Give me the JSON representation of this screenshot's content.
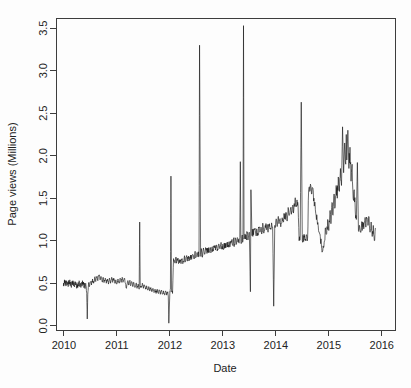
{
  "figure": {
    "background_color": "#fdfdfd",
    "line_color": "#111111",
    "axis_color": "#3d3d3d",
    "title_fragment": ""
  },
  "chart_data": {
    "type": "line",
    "title": "",
    "xlabel": "Date",
    "ylabel": "Page views (Millions)",
    "xlim": [
      2009.85,
      2016.25
    ],
    "ylim": [
      -0.05,
      3.62
    ],
    "xticks": [
      2010,
      2011,
      2012,
      2013,
      2014,
      2015,
      2016
    ],
    "xtick_labels": [
      "2010",
      "2011",
      "2012",
      "2013",
      "2014",
      "2015",
      "2016"
    ],
    "yticks": [
      0.0,
      0.5,
      1.0,
      1.5,
      2.0,
      2.5,
      3.0,
      3.5
    ],
    "ytick_labels": [
      "0.0",
      "0.5",
      "1.0",
      "1.5",
      "2.0",
      "2.5",
      "3.0",
      "3.5"
    ],
    "ytick_label_rotation_deg": -90,
    "grid": false,
    "legend": null,
    "series_name": "Daily page views",
    "units": "Millions",
    "sampling": "daily",
    "n_points_plotted": 640,
    "annotations": [
      {
        "label": "mid-2010 outage dip",
        "x": 2010.44,
        "y": 0.08
      },
      {
        "label": "2011 spike",
        "x": 2011.43,
        "y": 1.22
      },
      {
        "label": "2011-12 dip",
        "x": 2011.97,
        "y": 0.03
      },
      {
        "label": "early-2012 spike",
        "x": 2012.02,
        "y": 1.76
      },
      {
        "label": "2012 level shift up",
        "x": 2012.08,
        "y": 0.78
      },
      {
        "label": "mid-2012 spike",
        "x": 2012.55,
        "y": 3.3
      },
      {
        "label": "2013 tall spike",
        "x": 2013.39,
        "y": 3.53
      },
      {
        "label": "2013 spike b",
        "x": 2013.33,
        "y": 1.93
      },
      {
        "label": "2013 spike c",
        "x": 2013.55,
        "y": 1.6
      },
      {
        "label": "2013 dip",
        "x": 2013.52,
        "y": 0.4
      },
      {
        "label": "2014 dip",
        "x": 2014.02,
        "y": 0.23
      },
      {
        "label": "mid-2014 spike",
        "x": 2014.53,
        "y": 2.63
      },
      {
        "label": "2015 broad hump peak",
        "x": 2015.33,
        "y": 2.34
      },
      {
        "label": "late-2015 spike",
        "x": 2015.62,
        "y": 1.92
      }
    ],
    "x": [
      2009.99,
      2010.0,
      2010.01,
      2010.02,
      2010.03,
      2010.04,
      2010.05,
      2010.06,
      2010.07,
      2010.08,
      2010.09,
      2010.1,
      2010.11,
      2010.12,
      2010.13,
      2010.14,
      2010.15,
      2010.16,
      2010.17,
      2010.18,
      2010.19,
      2010.2,
      2010.21,
      2010.22,
      2010.23,
      2010.24,
      2010.25,
      2010.26,
      2010.27,
      2010.28,
      2010.29,
      2010.3,
      2010.31,
      2010.32,
      2010.33,
      2010.34,
      2010.35,
      2010.36,
      2010.37,
      2010.38,
      2010.39,
      2010.4,
      2010.41,
      2010.42,
      2010.43,
      2010.44,
      2010.45,
      2010.46,
      2010.47,
      2010.48,
      2010.5,
      2010.52,
      2010.54,
      2010.56,
      2010.58,
      2010.6,
      2010.62,
      2010.64,
      2010.66,
      2010.68,
      2010.7,
      2010.72,
      2010.74,
      2010.76,
      2010.78,
      2010.8,
      2010.82,
      2010.84,
      2010.86,
      2010.88,
      2010.9,
      2010.92,
      2010.94,
      2010.96,
      2010.98,
      2011.0,
      2011.02,
      2011.04,
      2011.06,
      2011.08,
      2011.1,
      2011.12,
      2011.14,
      2011.16,
      2011.18,
      2011.2,
      2011.22,
      2011.24,
      2011.26,
      2011.28,
      2011.3,
      2011.32,
      2011.34,
      2011.36,
      2011.38,
      2011.4,
      2011.42,
      2011.43,
      2011.44,
      2011.46,
      2011.48,
      2011.5,
      2011.52,
      2011.54,
      2011.56,
      2011.58,
      2011.6,
      2011.62,
      2011.64,
      2011.66,
      2011.68,
      2011.7,
      2011.72,
      2011.74,
      2011.76,
      2011.78,
      2011.8,
      2011.82,
      2011.84,
      2011.86,
      2011.88,
      2011.9,
      2011.92,
      2011.94,
      2011.96,
      2011.97,
      2011.98,
      2012.0,
      2012.01,
      2012.02,
      2012.03,
      2012.05,
      2012.07,
      2012.09,
      2012.11,
      2012.13,
      2012.15,
      2012.17,
      2012.19,
      2012.21,
      2012.23,
      2012.25,
      2012.27,
      2012.29,
      2012.31,
      2012.33,
      2012.35,
      2012.37,
      2012.39,
      2012.41,
      2012.43,
      2012.45,
      2012.47,
      2012.49,
      2012.51,
      2012.53,
      2012.54,
      2012.55,
      2012.56,
      2012.58,
      2012.6,
      2012.62,
      2012.64,
      2012.66,
      2012.68,
      2012.7,
      2012.72,
      2012.74,
      2012.76,
      2012.78,
      2012.8,
      2012.82,
      2012.84,
      2012.86,
      2012.88,
      2012.9,
      2012.92,
      2012.94,
      2012.96,
      2012.98,
      2013.0,
      2013.02,
      2013.04,
      2013.06,
      2013.08,
      2013.1,
      2013.12,
      2013.14,
      2013.16,
      2013.18,
      2013.2,
      2013.22,
      2013.24,
      2013.26,
      2013.28,
      2013.3,
      2013.32,
      2013.33,
      2013.34,
      2013.36,
      2013.38,
      2013.39,
      2013.4,
      2013.42,
      2013.44,
      2013.46,
      2013.48,
      2013.5,
      2013.52,
      2013.53,
      2013.55,
      2013.56,
      2013.58,
      2013.6,
      2013.62,
      2013.64,
      2013.66,
      2013.68,
      2013.7,
      2013.72,
      2013.74,
      2013.76,
      2013.78,
      2013.8,
      2013.82,
      2013.84,
      2013.86,
      2013.88,
      2013.9,
      2013.92,
      2013.94,
      2013.96,
      2013.98,
      2014.0,
      2014.02,
      2014.04,
      2014.06,
      2014.08,
      2014.1,
      2014.12,
      2014.14,
      2014.16,
      2014.18,
      2014.2,
      2014.22,
      2014.24,
      2014.26,
      2014.28,
      2014.3,
      2014.32,
      2014.34,
      2014.36,
      2014.38,
      2014.4,
      2014.42,
      2014.44,
      2014.46,
      2014.48,
      2014.5,
      2014.52,
      2014.53,
      2014.54,
      2014.56,
      2014.58,
      2014.6,
      2014.62,
      2014.64,
      2014.66,
      2014.68,
      2014.7,
      2014.72,
      2014.74,
      2014.76,
      2014.78,
      2014.8,
      2014.82,
      2014.84,
      2014.86,
      2014.88,
      2014.9,
      2014.92,
      2014.94,
      2014.96,
      2014.98,
      2015.0,
      2015.02,
      2015.04,
      2015.06,
      2015.08,
      2015.1,
      2015.12,
      2015.14,
      2015.16,
      2015.18,
      2015.2,
      2015.22,
      2015.24,
      2015.26,
      2015.28,
      2015.3,
      2015.32,
      2015.33,
      2015.34,
      2015.36,
      2015.38,
      2015.4,
      2015.42,
      2015.44,
      2015.46,
      2015.48,
      2015.5,
      2015.52,
      2015.54,
      2015.56,
      2015.58,
      2015.6,
      2015.62,
      2015.63,
      2015.64,
      2015.66,
      2015.68,
      2015.7,
      2015.72,
      2015.74,
      2015.76,
      2015.78,
      2015.8,
      2015.82,
      2015.84,
      2015.86,
      2015.88,
      2015.9,
      2015.92,
      2015.94,
      2015.96,
      2015.98,
      2016.0
    ],
    "y": [
      0.47,
      0.5,
      0.54,
      0.49,
      0.52,
      0.47,
      0.53,
      0.48,
      0.51,
      0.46,
      0.53,
      0.49,
      0.54,
      0.47,
      0.5,
      0.45,
      0.52,
      0.48,
      0.53,
      0.47,
      0.51,
      0.46,
      0.52,
      0.48,
      0.5,
      0.44,
      0.49,
      0.45,
      0.51,
      0.47,
      0.52,
      0.46,
      0.5,
      0.45,
      0.51,
      0.47,
      0.53,
      0.48,
      0.51,
      0.45,
      0.49,
      0.44,
      0.5,
      0.46,
      0.38,
      0.08,
      0.37,
      0.45,
      0.5,
      0.46,
      0.52,
      0.48,
      0.55,
      0.5,
      0.57,
      0.52,
      0.58,
      0.53,
      0.59,
      0.54,
      0.58,
      0.52,
      0.57,
      0.51,
      0.56,
      0.5,
      0.55,
      0.49,
      0.56,
      0.5,
      0.57,
      0.51,
      0.56,
      0.5,
      0.54,
      0.49,
      0.55,
      0.5,
      0.56,
      0.51,
      0.57,
      0.52,
      0.56,
      0.5,
      0.44,
      0.52,
      0.48,
      0.53,
      0.47,
      0.52,
      0.46,
      0.51,
      0.45,
      0.5,
      0.44,
      0.49,
      0.43,
      1.22,
      0.47,
      0.45,
      0.5,
      0.44,
      0.48,
      0.43,
      0.47,
      0.42,
      0.46,
      0.41,
      0.45,
      0.4,
      0.44,
      0.39,
      0.43,
      0.38,
      0.43,
      0.38,
      0.42,
      0.37,
      0.42,
      0.37,
      0.41,
      0.36,
      0.41,
      0.36,
      0.4,
      0.35,
      0.03,
      0.4,
      0.43,
      1.76,
      0.42,
      0.38,
      0.79,
      0.76,
      0.8,
      0.75,
      0.79,
      0.74,
      0.78,
      0.73,
      0.79,
      0.74,
      0.8,
      0.75,
      0.81,
      0.76,
      0.82,
      0.77,
      0.83,
      0.78,
      0.84,
      0.79,
      0.85,
      0.8,
      0.86,
      0.81,
      0.87,
      0.82,
      3.3,
      0.84,
      0.88,
      0.83,
      0.89,
      0.84,
      0.9,
      0.85,
      0.91,
      0.86,
      0.92,
      0.87,
      0.93,
      0.88,
      0.94,
      0.89,
      0.95,
      0.9,
      0.96,
      0.91,
      0.95,
      0.9,
      0.96,
      0.91,
      0.97,
      0.92,
      0.98,
      0.93,
      0.99,
      0.94,
      1.0,
      0.95,
      1.01,
      0.96,
      1.02,
      0.97,
      1.03,
      0.98,
      1.04,
      1.93,
      0.99,
      1.05,
      1.0,
      3.53,
      1.02,
      1.08,
      1.03,
      1.09,
      1.04,
      1.1,
      0.4,
      1.6,
      1.06,
      1.12,
      1.07,
      1.13,
      1.08,
      1.14,
      1.09,
      1.15,
      1.1,
      1.16,
      1.11,
      1.17,
      1.12,
      1.18,
      1.13,
      1.19,
      1.14,
      1.2,
      1.15,
      1.21,
      1.16,
      0.23,
      1.18,
      1.24,
      1.19,
      1.25,
      1.2,
      1.26,
      1.21,
      1.27,
      1.22,
      1.3,
      1.25,
      1.33,
      1.28,
      1.36,
      1.31,
      1.39,
      1.34,
      1.42,
      1.37,
      1.45,
      1.4,
      1.48,
      1.42,
      1.0,
      1.04,
      2.63,
      1.0,
      1.05,
      1.01,
      1.06,
      1.02,
      1.07,
      1.03,
      1.6,
      1.58,
      1.65,
      1.55,
      1.62,
      1.5,
      1.45,
      1.3,
      1.25,
      1.18,
      1.1,
      1.05,
      0.95,
      0.88,
      0.92,
      1.0,
      1.15,
      1.08,
      1.25,
      1.12,
      1.35,
      1.2,
      1.45,
      1.3,
      1.55,
      1.4,
      1.65,
      1.5,
      1.75,
      1.58,
      1.85,
      1.65,
      2.34,
      1.8,
      2.15,
      1.9,
      2.25,
      1.95,
      2.3,
      1.85,
      2.1,
      1.7,
      1.9,
      1.5,
      1.6,
      1.35,
      1.25,
      1.92,
      1.12,
      1.18,
      1.1,
      1.2,
      1.12,
      1.22,
      1.14,
      1.24,
      1.16,
      1.26,
      1.18,
      1.28,
      1.1,
      1.22,
      1.05,
      1.18,
      1.0,
      1.15
    ]
  }
}
